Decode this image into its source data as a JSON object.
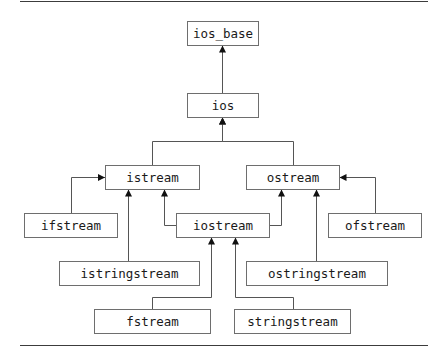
{
  "diagram": {
    "type": "class-hierarchy",
    "colors": {
      "line": "#555555",
      "box_border": "#6e6e6e",
      "text": "#1a1a1a",
      "rule": "#3c3c3c"
    },
    "nodes": [
      {
        "id": "ios_base",
        "label": "ios_base"
      },
      {
        "id": "ios",
        "label": "ios"
      },
      {
        "id": "istream",
        "label": "istream"
      },
      {
        "id": "ostream",
        "label": "ostream"
      },
      {
        "id": "ifstream",
        "label": "ifstream"
      },
      {
        "id": "iostream",
        "label": "iostream"
      },
      {
        "id": "ofstream",
        "label": "ofstream"
      },
      {
        "id": "istringstream",
        "label": "istringstream"
      },
      {
        "id": "ostringstream",
        "label": "ostringstream"
      },
      {
        "id": "fstream",
        "label": "fstream"
      },
      {
        "id": "stringstream",
        "label": "stringstream"
      }
    ],
    "edges": [
      {
        "from": "ios",
        "to": "ios_base"
      },
      {
        "from": "istream",
        "to": "ios"
      },
      {
        "from": "ostream",
        "to": "ios"
      },
      {
        "from": "ifstream",
        "to": "istream"
      },
      {
        "from": "istringstream",
        "to": "istream"
      },
      {
        "from": "iostream",
        "to": "istream"
      },
      {
        "from": "iostream",
        "to": "ostream"
      },
      {
        "from": "ostringstream",
        "to": "ostream"
      },
      {
        "from": "ofstream",
        "to": "ostream"
      },
      {
        "from": "fstream",
        "to": "iostream"
      },
      {
        "from": "stringstream",
        "to": "iostream"
      }
    ]
  }
}
